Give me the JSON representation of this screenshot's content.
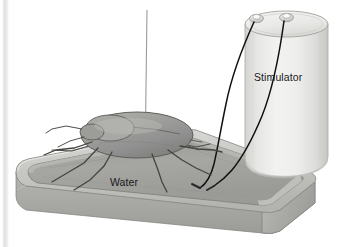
{
  "figure": {
    "type": "scientific-illustration",
    "background_color": "#ffffff",
    "width": 338,
    "height": 247,
    "labels": {
      "stimulator": "Stimulator",
      "water": "Water"
    },
    "label_color": "#1a1a1a",
    "parts": {
      "tray": {
        "name": "water-tray",
        "rim_color": "#c9c9c6",
        "interior_color": "#9e9e9b",
        "front_face_color": "#a8a8a5",
        "outline_color": "#8a8a87"
      },
      "water": {
        "name": "water-surface",
        "color": "#a3a3a0"
      },
      "insect": {
        "name": "cockroach",
        "body_color": "#9a9a97",
        "outline_color": "#5a5a57",
        "leg_color": "#4a4a47",
        "leg_count": 6
      },
      "electrode": {
        "name": "electrode-pin",
        "color": "#9b9b98"
      },
      "stimulator": {
        "name": "stimulator-cylinder",
        "body_color": "#e8e8e6",
        "top_color": "#efefed",
        "outline_color": "#9e9e9b",
        "terminal_color": "#d8d8d6",
        "terminal_count": 2
      },
      "wires": {
        "name": "stimulator-wires",
        "color": "#111111",
        "count": 2
      },
      "left_strip": {
        "name": "left-edge-strip",
        "color": "#e2e2e2"
      }
    }
  }
}
